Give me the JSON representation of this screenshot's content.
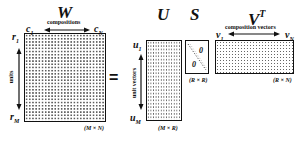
{
  "equation": {
    "equals_sign": "="
  },
  "W": {
    "title": "W",
    "top_label": "compositions",
    "col_first": {
      "base": "c",
      "sub": "1"
    },
    "col_last": {
      "base": "c",
      "sub": "N"
    },
    "side_label": "units",
    "row_first": {
      "base": "r",
      "sub": "1"
    },
    "row_last": {
      "base": "r",
      "sub": "M"
    },
    "dims": "(M × N)"
  },
  "U": {
    "title": "U",
    "side_label": "unit vectors",
    "row_first": {
      "base": "u",
      "sub": "1"
    },
    "row_last": {
      "base": "u",
      "sub": "M"
    },
    "dims": "(M × R)"
  },
  "S": {
    "title": "S",
    "upper_zero": "0",
    "lower_zero": "0",
    "dims": "(R × R)"
  },
  "VT": {
    "title": "V",
    "title_sup": "T",
    "top_label": "composition vectors",
    "col_first": {
      "base": "v",
      "sub": "1"
    },
    "col_last": {
      "base": "v",
      "sub": "N"
    },
    "dims": "(R × N)"
  },
  "colors": {
    "ink": "#111111",
    "background": "#ffffff"
  }
}
